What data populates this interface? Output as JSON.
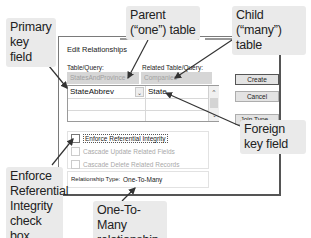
{
  "dialog": {
    "title": "Edit Relationships",
    "help_glyph": "?",
    "close_glyph": "×",
    "table_query_label": "Table/Query:",
    "related_table_query_label": "Related Table/Query:",
    "table_query_value": "StatesAndProvince",
    "related_table_query_value": "Companies",
    "grid": {
      "rows": [
        {
          "left": "StateAbbrev",
          "right": "State"
        },
        {
          "left": "",
          "right": ""
        },
        {
          "left": "",
          "right": ""
        }
      ],
      "dropdown_glyph": "⌄",
      "scroll_up_glyph": "^",
      "scroll_down_glyph": "⌄"
    },
    "buttons": {
      "create": "Create",
      "cancel": "Cancel",
      "join_type": "Join Type..."
    },
    "checkboxes": [
      {
        "label": "Enforce Referential Integrity",
        "checked": false,
        "enabled": true
      },
      {
        "label": "Cascade Update Related Fields",
        "checked": false,
        "enabled": false
      },
      {
        "label": "Cascade Delete Related Records",
        "checked": false,
        "enabled": false
      }
    ],
    "relationship_type_label": "Relationship Type:",
    "relationship_type_value": "One-To-Many"
  },
  "callouts": {
    "primary_key": "Primary key field",
    "parent_table": "Parent (“one”) table",
    "child_table": "Child (“many”) table",
    "foreign_key": "Foreign key field",
    "enforce_ri": "Enforce Referential Integrity check box",
    "one_to_many": "One-To-Many relationship"
  },
  "colors": {
    "callout_bg": "#eaeaea",
    "combo_bg": "#d6d6d6",
    "button_bg": "#e3e3e3",
    "arrow": "#333333"
  }
}
